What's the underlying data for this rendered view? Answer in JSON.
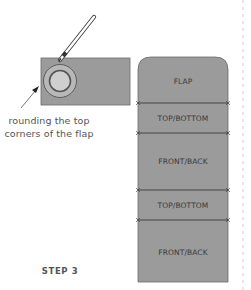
{
  "step": {
    "label": "STEP 3"
  },
  "callout": {
    "line1": "rounding the top",
    "line2": "corners of the flap"
  },
  "strip": {
    "sections": [
      {
        "label": "FLAP"
      },
      {
        "label": "TOP/BOTTOM"
      },
      {
        "label": "FRONT/BACK"
      },
      {
        "label": "TOP/BOTTOM"
      },
      {
        "label": "FRONT/BACK"
      }
    ]
  },
  "colors": {
    "panel_fill": "#9b9b9b",
    "panel_stroke": "#6a6a6a",
    "fold_line": "#3a3a3a",
    "text": "#555555",
    "dashed_edge": "#cfcfcf"
  },
  "icons": {
    "pencil": "pencil-icon",
    "round-template": "circle-template-icon",
    "pointer": "arrow-icon"
  }
}
